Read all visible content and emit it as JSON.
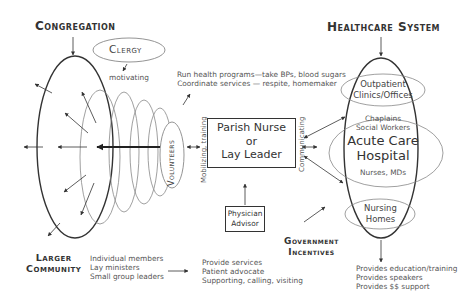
{
  "headings": {
    "congregation": "Congregation",
    "healthcare_system": "Healthcare System",
    "larger_community": [
      "Larger",
      "Community"
    ],
    "government_incentives": [
      "Government",
      "Incentives"
    ]
  },
  "clergy": {
    "label": "Clergy",
    "action": "motivating"
  },
  "volunteers": {
    "label": "Volunteers",
    "action": "Mobilizing, training"
  },
  "volunteer_tasks": [
    "Run health programs—take BPs, blood sugars",
    "Coordinate services — respite, homemaker"
  ],
  "central_box": {
    "lines": [
      "Parish Nurse",
      "or",
      "Lay Leader"
    ]
  },
  "physician_advisor": {
    "lines": [
      "Physician",
      "Advisor"
    ]
  },
  "communicating_label": "Communicating",
  "healthcare": {
    "outpatient": [
      "Outpatient",
      "Clinics/Offices"
    ],
    "acute_care_staff_top": [
      "Chaplains",
      "Social Workers"
    ],
    "acute_care": [
      "Acute Care",
      "Hospital"
    ],
    "acute_care_staff_bottom": "Nurses, MDs",
    "nursing_homes": [
      "Nursing",
      "Homes"
    ]
  },
  "community_members": [
    "Individual members",
    "Lay ministers",
    "Small group leaders"
  ],
  "community_services": [
    "Provide services",
    "Patient advocate",
    "Supporting, calling, visiting"
  ],
  "healthcare_provides": [
    "Provides education/training",
    "Provides speakers",
    "Provides $$ support"
  ],
  "colors": {
    "stroke_dark": "#333333",
    "stroke_light": "#888888",
    "text": "#555555",
    "background": "#ffffff"
  }
}
